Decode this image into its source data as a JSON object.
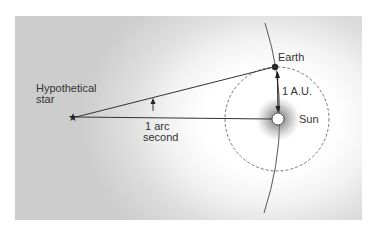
{
  "diagram": {
    "labels": {
      "star_line1": "Hypothetical",
      "star_line2": "star",
      "angle_line1": "1 arc",
      "angle_line2": "second",
      "earth": "Earth",
      "distance": "1 A.U.",
      "sun": "Sun"
    },
    "elements": {
      "star": {
        "symbol": "★",
        "x": 73,
        "y": 117
      },
      "earth": {
        "x": 275,
        "y": 67,
        "r": 3
      },
      "sun": {
        "x": 278,
        "y": 119,
        "r": 6
      },
      "orbit": {
        "cx": 277,
        "cy": 119,
        "r": 52,
        "style": "dashed"
      }
    },
    "colors": {
      "line": "#333333",
      "panel_edge": "#cdcdcd",
      "panel_center": "#ffffff",
      "halo": "#7a7a7a"
    }
  }
}
